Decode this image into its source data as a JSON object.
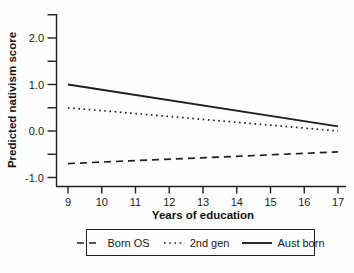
{
  "figure": {
    "background": "#fefefe",
    "ink_color": "#1f1f1f"
  },
  "chart_data": {
    "type": "line",
    "title": "",
    "xlabel": "Years of education",
    "ylabel": "Predicted nativism score",
    "xlim": [
      9,
      17
    ],
    "ylim": [
      -1.2,
      2.5
    ],
    "x_ticks": [
      9,
      10,
      11,
      12,
      13,
      14,
      15,
      16,
      17
    ],
    "y_major_ticks": [
      2.0,
      1.0,
      0.0,
      -1.0
    ],
    "y_tick_labels": [
      "2.0",
      "1.0",
      "0.0",
      "-1.0"
    ],
    "y_minor_ticks": [
      2.5,
      1.5,
      0.5,
      -0.5
    ],
    "grid": false,
    "legend_position": "bottom",
    "x": [
      9,
      17
    ],
    "series": [
      {
        "name": "Born OS",
        "style": "dashed",
        "values": [
          -0.7,
          -0.45
        ]
      },
      {
        "name": "2nd gen",
        "style": "dotted",
        "values": [
          0.5,
          0.0
        ]
      },
      {
        "name": "Aust born",
        "style": "solid",
        "values": [
          1.0,
          0.1
        ]
      }
    ]
  }
}
